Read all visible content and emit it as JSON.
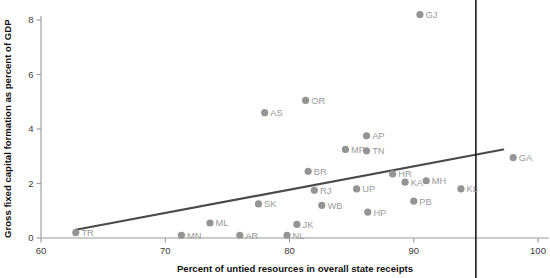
{
  "chart_data": {
    "type": "scatter",
    "title": "",
    "xlabel": "Percent of untied resources in overall state receipts",
    "ylabel": "Gross fixed capital formation as percent of GDP",
    "xlim": [
      60,
      100
    ],
    "ylim": [
      0,
      8.6
    ],
    "xticks": [
      60,
      70,
      80,
      90,
      100
    ],
    "yticks": [
      0,
      2,
      4,
      6,
      8
    ],
    "grid": false,
    "legend": "none",
    "points": [
      {
        "label": "TR",
        "x": 62.8,
        "y": 0.2
      },
      {
        "label": "MN",
        "x": 71.3,
        "y": 0.1
      },
      {
        "label": "ML",
        "x": 73.6,
        "y": 0.55
      },
      {
        "label": "AR",
        "x": 76.0,
        "y": 0.1
      },
      {
        "label": "SK",
        "x": 77.5,
        "y": 1.25
      },
      {
        "label": "NL",
        "x": 79.8,
        "y": 0.1
      },
      {
        "label": "JK",
        "x": 80.6,
        "y": 0.5
      },
      {
        "label": "AS",
        "x": 78.0,
        "y": 4.6
      },
      {
        "label": "OR",
        "x": 81.3,
        "y": 5.05
      },
      {
        "label": "BR",
        "x": 81.5,
        "y": 2.45
      },
      {
        "label": "RJ",
        "x": 82.0,
        "y": 1.75
      },
      {
        "label": "WB",
        "x": 82.6,
        "y": 1.2
      },
      {
        "label": "MP",
        "x": 84.5,
        "y": 3.25
      },
      {
        "label": "AP",
        "x": 86.2,
        "y": 3.75
      },
      {
        "label": "TN",
        "x": 86.2,
        "y": 3.2
      },
      {
        "label": "UP",
        "x": 85.4,
        "y": 1.8
      },
      {
        "label": "HP",
        "x": 86.3,
        "y": 0.95
      },
      {
        "label": "HR",
        "x": 88.3,
        "y": 2.35
      },
      {
        "label": "KA",
        "x": 89.3,
        "y": 2.05
      },
      {
        "label": "MH",
        "x": 91.0,
        "y": 2.1
      },
      {
        "label": "PB",
        "x": 90.0,
        "y": 1.35
      },
      {
        "label": "KL",
        "x": 93.8,
        "y": 1.8
      },
      {
        "label": "GJ",
        "x": 90.5,
        "y": 8.2
      },
      {
        "label": "GA",
        "x": 98.0,
        "y": 2.95
      }
    ],
    "trend_line": {
      "x0": 62.8,
      "y0": 0.3,
      "x1": 97.2,
      "y1": 3.25
    },
    "reference_line": {
      "x": 95.0
    }
  },
  "colors": {
    "point": "#949494",
    "point_label": "#9a9a9a",
    "axis": "#9a9a9a",
    "trend": "#4a4a4a",
    "reference": "#1b1b1b",
    "axis_title": "#111111"
  }
}
